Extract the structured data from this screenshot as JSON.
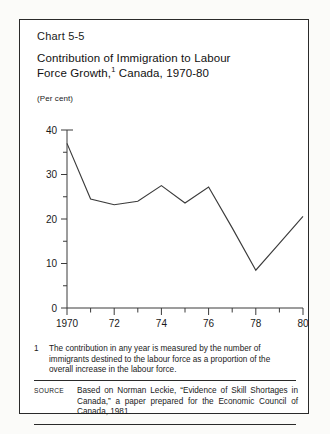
{
  "figure": {
    "number": "Chart 5-5",
    "title_line1": "Contribution of Immigration to Labour",
    "title_line2_pre": "Force Growth,",
    "title_footnote_marker": "1",
    "title_line2_post": " Canada, 1970-80",
    "unit_label": "(Per cent)",
    "footnote": {
      "marker": "1",
      "text": "The contribution in any year is measured by the number of immigrants destined to the labour force as a proportion of the overall increase in the labour force."
    },
    "source": {
      "label": "Source",
      "text": "Based on Norman Leckie, “Evidence of Skill Shortages in Canada,” a paper prepared for the Economic Council of Canada, 1981."
    }
  },
  "chart_data": {
    "type": "line",
    "xlabel": "",
    "ylabel": "(Per cent)",
    "ylim": [
      0,
      40
    ],
    "xlim": [
      1970,
      1980
    ],
    "grid": false,
    "legend": null,
    "line_color": "#3b3b3b",
    "x": [
      1970,
      1971,
      1972,
      1973,
      1974,
      1975,
      1976,
      1977,
      1978,
      1979,
      1980
    ],
    "values": [
      37.0,
      24.5,
      23.2,
      24.0,
      27.5,
      23.6,
      27.2,
      18.0,
      8.5,
      14.5,
      20.6
    ],
    "y_ticks_major": [
      0,
      10,
      20,
      30,
      40
    ],
    "y_tick_labels": [
      "0",
      "10",
      "20",
      "30",
      "40"
    ],
    "y_ticks_minor": [
      5,
      15,
      25,
      35
    ],
    "x_ticks_major": [
      1970,
      1972,
      1974,
      1976,
      1978,
      1980
    ],
    "x_tick_labels": [
      "1970",
      "72",
      "74",
      "76",
      "78",
      "80"
    ],
    "x_ticks_minor": [
      1971,
      1973,
      1975,
      1977,
      1979
    ]
  }
}
